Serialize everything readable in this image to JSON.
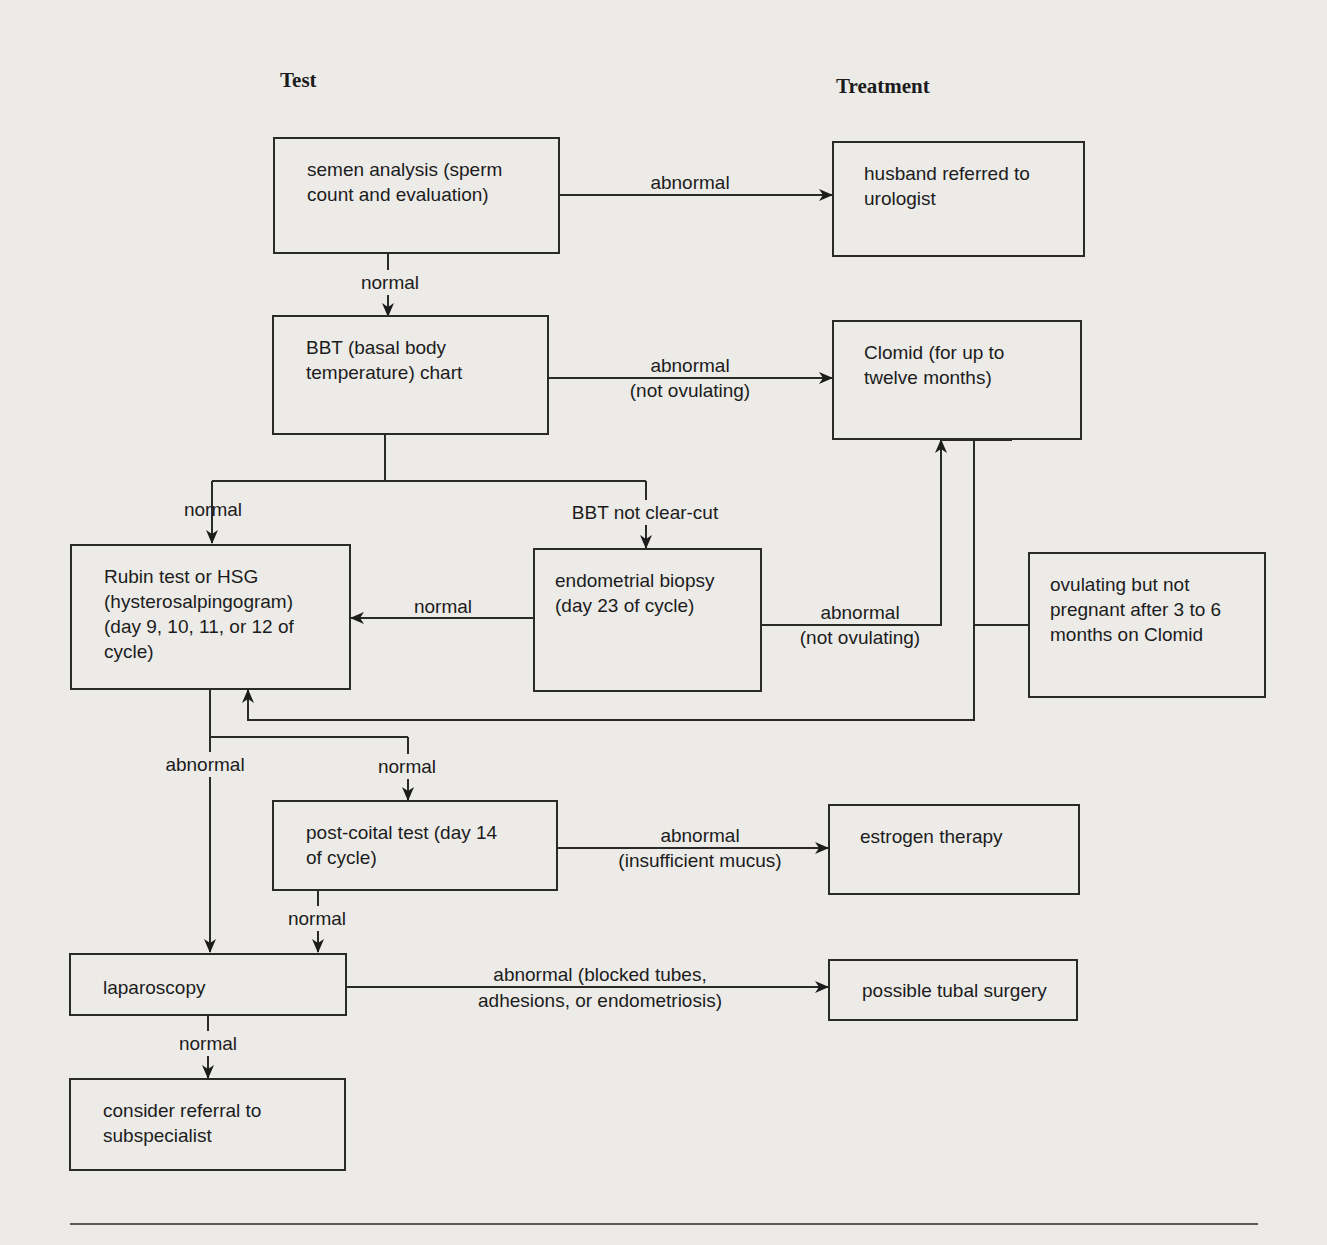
{
  "headers": {
    "test": "Test",
    "treatment": "Treatment"
  },
  "nodes": {
    "semen_analysis": "semen analysis (sperm\ncount and evaluation)",
    "husband_referred": "husband referred to\nurologist",
    "bbt_chart": "BBT (basal body\ntemperature) chart",
    "clomid": "Clomid (for up to\ntwelve months)",
    "rubin_hsg": "Rubin test or HSG\n(hysterosalpingogram)\n(day 9, 10, 11, or 12 of\ncycle)",
    "endometrial_biopsy": "endometrial biopsy\n(day 23 of cycle)",
    "ovulating_not_pregnant": "ovulating but not\npregnant after 3 to 6\nmonths on Clomid",
    "post_coital": "post-coital test (day 14\nof cycle)",
    "estrogen": "estrogen therapy",
    "laparoscopy": "laparoscopy",
    "tubal_surgery": "possible tubal surgery",
    "subspecialist": "consider referral to\nsubspecialist"
  },
  "edges": {
    "semen_abnormal": "abnormal",
    "semen_normal": "normal",
    "bbt_abnormal": "abnormal\n(not ovulating)",
    "bbt_normal": "normal",
    "bbt_not_clear": "BBT not clear-cut",
    "biopsy_normal": "normal",
    "biopsy_abnormal": "abnormal\n(not ovulating)",
    "hsg_abnormal": "abnormal",
    "hsg_normal": "normal",
    "postcoital_abnormal": "abnormal\n(insufficient mucus)",
    "postcoital_normal": "normal",
    "laparoscopy_abnormal": "abnormal (blocked tubes,\nadhesions, or endometriosis)",
    "laparoscopy_normal": "normal"
  }
}
